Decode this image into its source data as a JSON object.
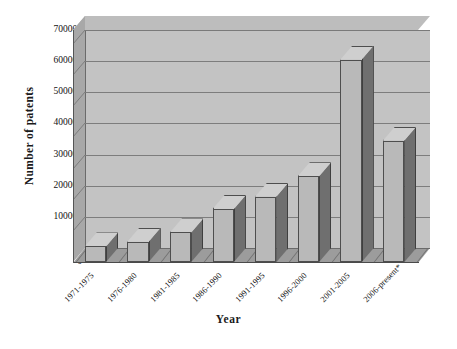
{
  "chart_data": {
    "type": "bar",
    "title": "",
    "xlabel": "Year",
    "ylabel": "Number of patents",
    "categories": [
      "1971-1975",
      "1976-1980",
      "1981-1985",
      "1986-1990",
      "1991-1995",
      "1996-2000",
      "2001-2005",
      "2006-present*"
    ],
    "values": [
      50000,
      65000,
      95000,
      170000,
      210000,
      275000,
      650000,
      390000
    ],
    "ylim": [
      0,
      700000
    ],
    "ytick_labels": [
      "0",
      "100000",
      "200000",
      "300000",
      "400000",
      "500000",
      "600000",
      "700000"
    ],
    "ytick_values": [
      0,
      100000,
      200000,
      300000,
      400000,
      500000,
      600000,
      700000
    ],
    "ytick_step": 100000,
    "grid": true,
    "legend": false,
    "legend_position": "none",
    "style": "3d-column",
    "series": [
      {
        "name": "Number of patents",
        "values": [
          50000,
          65000,
          95000,
          170000,
          210000,
          275000,
          650000,
          390000
        ]
      }
    ],
    "colors": {
      "bar_front": "#b9b9b9",
      "bar_side": "#6f6f6f",
      "bar_top": "#cfcfcf",
      "wall_back": "#c3c3c3",
      "wall_left": "#a8a8a8",
      "wall_top": "#bdbdbd",
      "floor": "#9c9c9c",
      "gridline": "#7d7d7d",
      "text": "#111111",
      "background": "#ffffff"
    }
  }
}
